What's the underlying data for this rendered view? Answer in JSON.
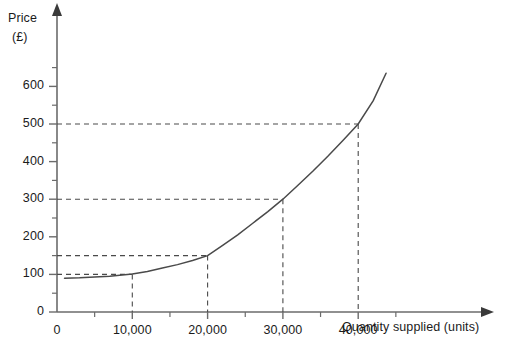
{
  "chart_data": {
    "type": "line",
    "title": "",
    "subtitle": "",
    "xlabel": "Quantity supplied (units)",
    "ylabel": "Price",
    "ylabel_unit": "(£)",
    "xlim": [
      0,
      45000
    ],
    "ylim": [
      0,
      650
    ],
    "grid": false,
    "legend": "none",
    "x_ticks_major": [
      {
        "value": 0,
        "label": "0"
      },
      {
        "value": 10000,
        "label": "10,000"
      },
      {
        "value": 20000,
        "label": "20,000"
      },
      {
        "value": 30000,
        "label": "30,000"
      },
      {
        "value": 40000,
        "label": "40,000"
      }
    ],
    "x_ticks_minor": [
      5000,
      15000,
      25000,
      35000,
      45000
    ],
    "y_ticks_major": [
      {
        "value": 0,
        "label": "0"
      },
      {
        "value": 100,
        "label": "100"
      },
      {
        "value": 200,
        "label": "200"
      },
      {
        "value": 300,
        "label": "300"
      },
      {
        "value": 400,
        "label": "400"
      },
      {
        "value": 500,
        "label": "500"
      },
      {
        "value": 600,
        "label": "600"
      }
    ],
    "y_ticks_minor": [
      50,
      150,
      250,
      350,
      450,
      550,
      650
    ],
    "series": [
      {
        "name": "Supply curve",
        "color": "#4a4a4a",
        "points": [
          {
            "x": 1000,
            "y": 90
          },
          {
            "x": 3000,
            "y": 91
          },
          {
            "x": 5000,
            "y": 93
          },
          {
            "x": 7000,
            "y": 95
          },
          {
            "x": 9000,
            "y": 99
          },
          {
            "x": 10000,
            "y": 101
          },
          {
            "x": 12000,
            "y": 108
          },
          {
            "x": 14000,
            "y": 117
          },
          {
            "x": 16000,
            "y": 126
          },
          {
            "x": 18000,
            "y": 137
          },
          {
            "x": 20000,
            "y": 150
          },
          {
            "x": 22000,
            "y": 177
          },
          {
            "x": 24000,
            "y": 205
          },
          {
            "x": 26000,
            "y": 236
          },
          {
            "x": 28000,
            "y": 267
          },
          {
            "x": 30000,
            "y": 300
          },
          {
            "x": 32000,
            "y": 337
          },
          {
            "x": 34000,
            "y": 375
          },
          {
            "x": 36000,
            "y": 415
          },
          {
            "x": 38000,
            "y": 457
          },
          {
            "x": 40000,
            "y": 500
          },
          {
            "x": 42000,
            "y": 562
          },
          {
            "x": 43700,
            "y": 635
          }
        ]
      }
    ],
    "annotations": [
      {
        "name": "guide-100",
        "price": 100,
        "quantity": 10000,
        "label": "100"
      },
      {
        "name": "guide-150",
        "price": 150,
        "quantity": 20000,
        "label": "150"
      },
      {
        "name": "guide-300",
        "price": 300,
        "quantity": 30000,
        "label": "300"
      },
      {
        "name": "guide-500",
        "price": 500,
        "quantity": 40000,
        "label": "500"
      }
    ],
    "guide_points": [
      {
        "quantity": 10000,
        "price": 100
      },
      {
        "quantity": 20000,
        "price": 150
      },
      {
        "quantity": 30000,
        "price": 300
      },
      {
        "quantity": 40000,
        "price": 500
      }
    ],
    "colors": {
      "curve": "#4a4a4a",
      "axis": "#6b6b6b",
      "guide": "#4a4a4a",
      "text": "#1b1b1b",
      "background": "#ffffff"
    }
  }
}
